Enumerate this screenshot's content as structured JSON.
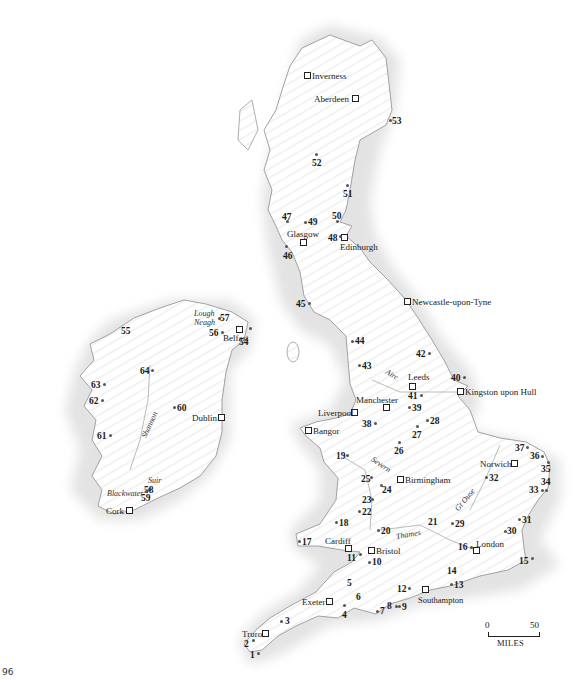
{
  "page": {
    "number": "96"
  },
  "colors": {
    "land": "#ffffff",
    "sea_halo": "#e6e6e6",
    "coast": "#9a9a9a",
    "hatch": "#f0f0f0",
    "text": "#1a1a1a",
    "marker": "#555555"
  },
  "scale_bar": {
    "start": "0",
    "end": "50",
    "unit": "MILES"
  },
  "cities": [
    {
      "name": "Inverness",
      "x": 306,
      "y": 75,
      "lx": 312,
      "ly": 71,
      "label_side": "right"
    },
    {
      "name": "Aberdeen",
      "x": 354,
      "y": 98,
      "lx": 313,
      "ly": 94,
      "label_side": "left"
    },
    {
      "name": "Glasgow",
      "x": 302,
      "y": 242,
      "lx": 286,
      "ly": 230,
      "label_side": "above"
    },
    {
      "name": "Edinburgh",
      "x": 343,
      "y": 237,
      "lx": 340,
      "ly": 243,
      "label_side": "below"
    },
    {
      "name": "Newcastle-upon-Tyne",
      "x": 406,
      "y": 301,
      "lx": 413,
      "ly": 297,
      "label_side": "right"
    },
    {
      "name": "Belfast",
      "x": 238,
      "y": 329,
      "lx": 223,
      "ly": 333,
      "label_side": "below-left"
    },
    {
      "name": "Leeds",
      "x": 411,
      "y": 384,
      "lx": 409,
      "ly": 373,
      "label_side": "above"
    },
    {
      "name": "Kingston upon Hull",
      "x": 459,
      "y": 391,
      "lx": 466,
      "ly": 387,
      "label_side": "right"
    },
    {
      "name": "Manchester",
      "x": 385,
      "y": 408,
      "lx": 356,
      "ly": 396,
      "label_side": "above-left"
    },
    {
      "name": "Liverpool",
      "x": 353,
      "y": 412,
      "lx": 318,
      "ly": 408,
      "label_side": "left"
    },
    {
      "name": "Dublin",
      "x": 220,
      "y": 417,
      "lx": 193,
      "ly": 413,
      "label_side": "left"
    },
    {
      "name": "Bangor",
      "x": 307,
      "y": 430,
      "lx": 313,
      "ly": 426,
      "label_side": "right"
    },
    {
      "name": "Birmingham",
      "x": 399,
      "y": 479,
      "lx": 406,
      "ly": 475,
      "label_side": "right"
    },
    {
      "name": "Norwich",
      "x": 513,
      "y": 463,
      "lx": 481,
      "ly": 459,
      "label_side": "left"
    },
    {
      "name": "Cork",
      "x": 128,
      "y": 510,
      "lx": 107,
      "ly": 506,
      "label_side": "left"
    },
    {
      "name": "Cardiff",
      "x": 347,
      "y": 548,
      "lx": 326,
      "ly": 537,
      "label_side": "above"
    },
    {
      "name": "Bristol",
      "x": 369,
      "y": 550,
      "lx": 376,
      "ly": 546,
      "label_side": "right"
    },
    {
      "name": "London",
      "x": 475,
      "y": 551,
      "lx": 476,
      "ly": 540,
      "label_side": "above-right"
    },
    {
      "name": "Exeter",
      "x": 328,
      "y": 601,
      "lx": 303,
      "ly": 597,
      "label_side": "left"
    },
    {
      "name": "Southampton",
      "x": 424,
      "y": 589,
      "lx": 418,
      "ly": 596,
      "label_side": "below"
    },
    {
      "name": "Truro",
      "x": 264,
      "y": 633,
      "lx": 243,
      "ly": 629,
      "label_side": "left"
    }
  ],
  "sites": [
    {
      "n": "1",
      "x": 257,
      "y": 651
    },
    {
      "n": "2",
      "x": 246,
      "y": 642
    },
    {
      "n": "3",
      "x": 282,
      "y": 619
    },
    {
      "n": "4",
      "x": 344,
      "y": 606
    },
    {
      "n": "5",
      "x": 350,
      "y": 582
    },
    {
      "n": "6",
      "x": 358,
      "y": 597
    },
    {
      "n": "7",
      "x": 379,
      "y": 611
    },
    {
      "n": "8",
      "x": 391,
      "y": 605
    },
    {
      "n": "9",
      "x": 399,
      "y": 606
    },
    {
      "n": "10",
      "x": 370,
      "y": 561
    },
    {
      "n": "11",
      "x": 352,
      "y": 555
    },
    {
      "n": "12",
      "x": 404,
      "y": 588
    },
    {
      "n": "13",
      "x": 452,
      "y": 583
    },
    {
      "n": "14",
      "x": 451,
      "y": 570
    },
    {
      "n": "15",
      "x": 519,
      "y": 559
    },
    {
      "n": "16",
      "x": 471,
      "y": 548
    },
    {
      "n": "17",
      "x": 299,
      "y": 541
    },
    {
      "n": "18",
      "x": 336,
      "y": 522
    },
    {
      "n": "19",
      "x": 345,
      "y": 455
    },
    {
      "n": "20",
      "x": 378,
      "y": 530
    },
    {
      "n": "21",
      "x": 431,
      "y": 522
    },
    {
      "n": "22",
      "x": 359,
      "y": 511
    },
    {
      "n": "23",
      "x": 371,
      "y": 500
    },
    {
      "n": "24",
      "x": 390,
      "y": 487
    },
    {
      "n": "25",
      "x": 370,
      "y": 478
    },
    {
      "n": "26",
      "x": 399,
      "y": 448
    },
    {
      "n": "27",
      "x": 418,
      "y": 431
    },
    {
      "n": "28",
      "x": 431,
      "y": 420
    },
    {
      "n": "29",
      "x": 452,
      "y": 523
    },
    {
      "n": "30",
      "x": 508,
      "y": 530
    },
    {
      "n": "31",
      "x": 519,
      "y": 518
    },
    {
      "n": "32",
      "x": 484,
      "y": 476
    },
    {
      "n": "33",
      "x": 541,
      "y": 488
    },
    {
      "n": "34",
      "x": 545,
      "y": 480
    },
    {
      "n": "35",
      "x": 547,
      "y": 466
    },
    {
      "n": "36",
      "x": 540,
      "y": 455
    },
    {
      "n": "37",
      "x": 525,
      "y": 447
    },
    {
      "n": "38",
      "x": 374,
      "y": 423
    },
    {
      "n": "39",
      "x": 407,
      "y": 407
    },
    {
      "n": "40",
      "x": 464,
      "y": 377
    },
    {
      "n": "41",
      "x": 420,
      "y": 394
    },
    {
      "n": "42",
      "x": 429,
      "y": 354
    },
    {
      "n": "43",
      "x": 357,
      "y": 337
    },
    {
      "n": "44",
      "x": 352,
      "y": 340
    },
    {
      "n": "45",
      "x": 307,
      "y": 303
    },
    {
      "n": "46",
      "x": 286,
      "y": 247
    },
    {
      "n": "47",
      "x": 287,
      "y": 220
    },
    {
      "n": "48",
      "x": 339,
      "y": 237
    },
    {
      "n": "49",
      "x": 305,
      "y": 222
    },
    {
      "n": "50",
      "x": 337,
      "y": 221
    },
    {
      "n": "51",
      "x": 347,
      "y": 185
    },
    {
      "n": "52",
      "x": 316,
      "y": 153
    },
    {
      "n": "53",
      "x": 389,
      "y": 120
    },
    {
      "n": "54",
      "x": 248,
      "y": 327
    },
    {
      "n": "55",
      "x": 126,
      "y": 330
    },
    {
      "n": "56",
      "x": 225,
      "y": 331
    },
    {
      "n": "57",
      "x": 220,
      "y": 318
    },
    {
      "n": "58",
      "x": 148,
      "y": 489
    },
    {
      "n": "59",
      "x": 145,
      "y": 494
    },
    {
      "n": "60",
      "x": 175,
      "y": 405
    },
    {
      "n": "61",
      "x": 107,
      "y": 434
    },
    {
      "n": "62",
      "x": 101,
      "y": 400
    },
    {
      "n": "63",
      "x": 99,
      "y": 383
    },
    {
      "n": "64",
      "x": 151,
      "y": 369
    }
  ],
  "rivers": [
    {
      "name": "Lough Neagh",
      "x": 194,
      "y": 312
    },
    {
      "name": "Shannon",
      "x": 145,
      "y": 420
    },
    {
      "name": "Blackwater",
      "x": 107,
      "y": 489
    },
    {
      "name": "Suir",
      "x": 147,
      "y": 481
    },
    {
      "name": "Aire",
      "x": 385,
      "y": 375
    },
    {
      "name": "Severn",
      "x": 372,
      "y": 462
    },
    {
      "name": "Thames",
      "x": 398,
      "y": 530
    },
    {
      "name": "Gt Ouse",
      "x": 453,
      "y": 497
    }
  ]
}
